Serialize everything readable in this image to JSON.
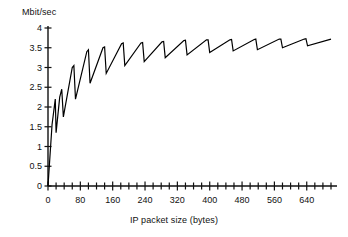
{
  "chart_data": {
    "type": "line",
    "title": "",
    "subtitle": "",
    "xlabel": "IP packet size (bytes)",
    "ylabel": "Mbit/sec",
    "xlim": [
      0,
      700
    ],
    "ylim": [
      0,
      4
    ],
    "grid": false,
    "legend": null,
    "x_major_ticks": [
      0,
      80,
      160,
      240,
      320,
      400,
      480,
      560,
      640
    ],
    "x_major_tick_labels": [
      "0",
      "80",
      "160",
      "240",
      "320",
      "400",
      "480",
      "560",
      "640"
    ],
    "x_minor_tick_step": 20,
    "y_ticks": [
      0,
      0.5,
      1,
      1.5,
      2,
      2.5,
      3,
      3.5,
      4
    ],
    "y_tick_labels": [
      "0",
      "0.5",
      "1",
      "1.5",
      "2",
      "2.5",
      "3",
      "3.5",
      "4"
    ],
    "series": [
      {
        "name": "throughput",
        "color": "#000000",
        "description": "Sawtooth throughput versus IP packet size; each tooth rises then drops sharply at a segmentation boundary, with the envelope approaching about 3.7 Mbit/sec.",
        "x": [
          0,
          10,
          18,
          20,
          29,
          34,
          38,
          60,
          64,
          68,
          96,
          100,
          104,
          136,
          140,
          144,
          182,
          186,
          190,
          230,
          234,
          238,
          282,
          286,
          290,
          336,
          340,
          344,
          392,
          396,
          400,
          450,
          454,
          458,
          510,
          514,
          518,
          572,
          576,
          580,
          634,
          638,
          642,
          700
        ],
        "y": [
          0,
          1.55,
          2.2,
          1.35,
          2.25,
          2.45,
          1.75,
          3.0,
          3.05,
          2.2,
          3.4,
          3.45,
          2.6,
          3.5,
          3.52,
          2.85,
          3.6,
          3.62,
          3.05,
          3.62,
          3.63,
          3.15,
          3.65,
          3.66,
          3.25,
          3.68,
          3.69,
          3.32,
          3.7,
          3.7,
          3.38,
          3.7,
          3.71,
          3.42,
          3.71,
          3.72,
          3.45,
          3.72,
          3.72,
          3.5,
          3.72,
          3.73,
          3.55,
          3.72
        ]
      }
    ]
  },
  "axis": {
    "y_title": "Mbit/sec",
    "x_title": "IP packet size (bytes)"
  }
}
